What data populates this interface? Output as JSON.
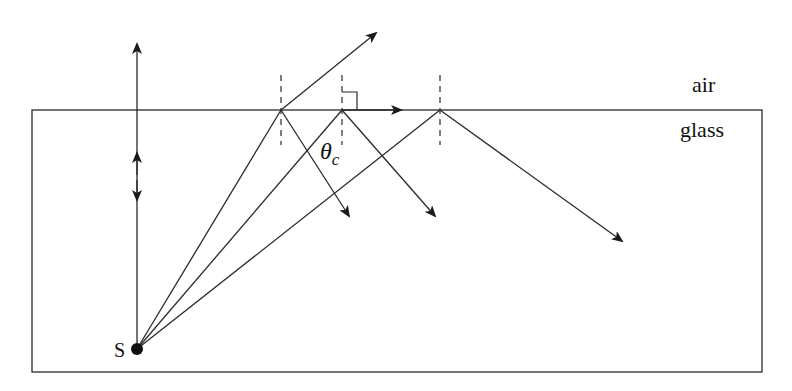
{
  "diagram": {
    "labels": {
      "upper_medium": "air",
      "lower_medium": "glass",
      "source": "S",
      "critical_angle_symbol": "θ",
      "critical_angle_subscript": "c"
    },
    "colors": {
      "line": "#2a2a2a",
      "background": "#ffffff"
    },
    "geometry": {
      "glass_block": {
        "x": 32,
        "y": 110,
        "width": 730,
        "height": 262
      },
      "source_point": {
        "x": 137,
        "y": 349
      },
      "incidence_points": [
        {
          "name": "below-critical",
          "x": 281,
          "y": 110
        },
        {
          "name": "at-critical",
          "x": 342,
          "y": 110
        },
        {
          "name": "above-critical",
          "x": 440,
          "y": 110
        }
      ]
    },
    "rays": [
      {
        "name": "normal-incidence",
        "from": [
          137,
          349
        ],
        "to": [
          137,
          42
        ],
        "note": "passes straight through, partial reflection back down"
      },
      {
        "name": "refracted-ray",
        "from": [
          281,
          110
        ],
        "to": [
          378,
          32
        ]
      },
      {
        "name": "grazing-ray-at-critical",
        "from": [
          342,
          110
        ],
        "to": [
          402,
          110
        ]
      },
      {
        "name": "reflected-1",
        "from": [
          281,
          110
        ],
        "to": [
          350,
          217
        ]
      },
      {
        "name": "reflected-2",
        "from": [
          342,
          110
        ],
        "to": [
          436,
          217
        ]
      },
      {
        "name": "reflected-3-total-internal",
        "from": [
          440,
          110
        ],
        "to": [
          624,
          242
        ]
      }
    ]
  }
}
